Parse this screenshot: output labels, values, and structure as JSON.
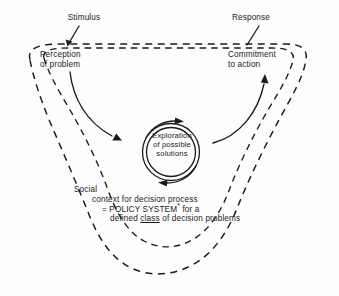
{
  "figure": {
    "background_color": "#fdfdfd",
    "ink_color": "#1a1a1a",
    "labels": {
      "stimulus": "Stimulus",
      "response": "Response",
      "perception_line1": "Perception",
      "perception_line2": "of problem",
      "commitment_line1": "Commitment",
      "commitment_line2": "to action",
      "exploration_line1": "Exploration",
      "exploration_line2": "of possible",
      "exploration_line3": "solutions",
      "social_line1": "Social",
      "social_line2": "context for decision process",
      "social_line3_prefix": "= POLICY SYSTEM",
      "social_line3_star": "*",
      "social_line3_suffix": " for a",
      "social_line4_prefix": "defined ",
      "social_line4_emphasis": "class",
      "social_line4_suffix": " of decision problems"
    },
    "elements": {
      "outer_boundary_name": "social-context-boundary-dashed",
      "inner_boundary_name": "decision-process-boundary-dashed",
      "core_circle_name": "exploration-double-circle",
      "rotation_arrows_name": "iteration-arrows"
    }
  }
}
